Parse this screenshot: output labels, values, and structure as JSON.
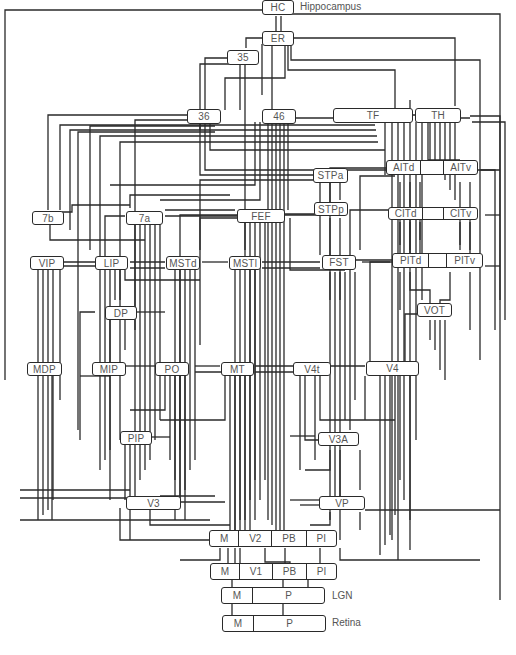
{
  "diagram": {
    "line_color": "#2a2a2a",
    "text_color": "#555555",
    "nodes": {
      "HC": "HC",
      "ER": "ER",
      "n35": "35",
      "n36": "36",
      "n46": "46",
      "TF": "TF",
      "TH": "TH",
      "STPa": "STPa",
      "AITd": "AITd",
      "AITv": "AITv",
      "n7b": "7b",
      "n7a": "7a",
      "FEF": "FEF",
      "STPp": "STPp",
      "CITd": "CITd",
      "CITv": "CITv",
      "VIP": "VIP",
      "LIP": "LIP",
      "MSTd": "MSTd",
      "MSTl": "MSTl",
      "FST": "FST",
      "PITd": "PITd",
      "PITv": "PITv",
      "DP": "DP",
      "VOT": "VOT",
      "MDP": "MDP",
      "MIP": "MIP",
      "PO": "PO",
      "MT": "MT",
      "V4t": "V4t",
      "V4": "V4",
      "PIP": "PIP",
      "V3A": "V3A",
      "V3": "V3",
      "VP": "VP"
    },
    "v2_row": [
      "M",
      "V2",
      "PB",
      "PI"
    ],
    "v1_row": [
      "M",
      "V1",
      "PB",
      "PI"
    ],
    "lgn_row": [
      "M",
      "P"
    ],
    "retina_row": [
      "M",
      "P"
    ],
    "side_labels": {
      "hippocampus": "Hippocampus",
      "lgn": "LGN",
      "retina": "Retina"
    }
  }
}
